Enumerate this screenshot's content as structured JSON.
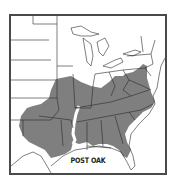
{
  "map": {
    "title": "POST OAK",
    "region": "Eastern United States",
    "legend": {
      "shaded_meaning": "native range",
      "shade_color": "#7f7f7f"
    },
    "colors": {
      "frame": "#4a4a4a",
      "borders": "#2a2a2a",
      "land": "#ffffff",
      "range": "#7f7f7f"
    }
  }
}
